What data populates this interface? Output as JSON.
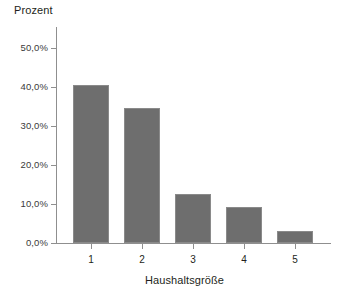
{
  "chart_data": {
    "type": "bar",
    "title": "",
    "subtitle": "",
    "xlabel": "Haushaltsgröße",
    "ylabel": "Prozent",
    "categories": [
      "1",
      "2",
      "3",
      "4",
      "5"
    ],
    "values": [
      40.5,
      34.7,
      12.6,
      9.3,
      3.1
    ],
    "value_labels": [
      "40,5%",
      "34,7%",
      "12,6%",
      "9,3%",
      "3,1%"
    ],
    "series": [
      {
        "name": "Prozent",
        "values": [
          40.5,
          34.7,
          12.6,
          9.3,
          3.1
        ]
      }
    ],
    "ylim": [
      0,
      50
    ],
    "ytick_values": [
      0,
      10,
      20,
      30,
      40,
      50
    ],
    "ytick_labels": [
      "0,0%",
      "10,0%",
      "20,0%",
      "30,0%",
      "40,0%",
      "50,0%"
    ],
    "xtick_labels": [
      "1",
      "2",
      "3",
      "4",
      "5"
    ],
    "grid": false,
    "legend": null,
    "legend_position": "none",
    "annotations": [],
    "bar_color": "#6e6e6e",
    "bar_edge_color": "#8a8a8a",
    "axis_color": "#8f8f8f",
    "background_color": "#ffffff",
    "text_color": "#231f20"
  },
  "layout": {
    "plot_left_px": 56,
    "plot_right_px": 331,
    "plot_top_px": 27,
    "baseline_px": 243,
    "px_per_percent": 3.9,
    "bar_width_px": 36,
    "bar_gap_px": 15,
    "first_bar_left_px": 73
  }
}
